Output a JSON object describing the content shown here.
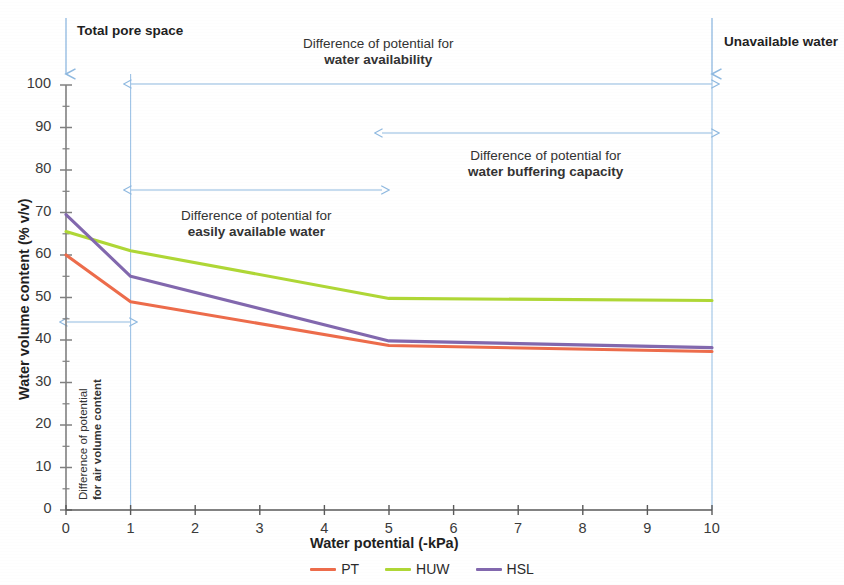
{
  "chart_data": {
    "type": "line",
    "title": "",
    "xlabel": "Water potential (-kPa)",
    "ylabel": "Water volume content (% v/v)",
    "xlim": [
      0,
      10
    ],
    "ylim": [
      0,
      100
    ],
    "xticks": [
      "0",
      "1",
      "2",
      "3",
      "4",
      "5",
      "6",
      "7",
      "8",
      "9",
      "10"
    ],
    "yticks": [
      "0",
      "10",
      "20",
      "30",
      "40",
      "50",
      "60",
      "70",
      "80",
      "90",
      "100"
    ],
    "y_minor_step": 5,
    "grid": false,
    "legend_position": "bottom",
    "x": [
      0,
      1,
      5,
      10
    ],
    "series": [
      {
        "name": "PT",
        "color": "#ED6C4B",
        "values": [
          60.0,
          49.0,
          38.7,
          37.3
        ]
      },
      {
        "name": "HUW",
        "color": "#AFD736",
        "values": [
          65.5,
          61.0,
          49.8,
          49.3
        ]
      },
      {
        "name": "HSL",
        "color": "#8268AE",
        "values": [
          69.5,
          55.0,
          39.8,
          38.2
        ]
      }
    ],
    "annotations": [
      {
        "id": "total-pore-space",
        "text": "Total pore space",
        "style": "bold",
        "at_x": 0,
        "kind": "down-arrow-callout"
      },
      {
        "id": "unavailable-water",
        "text": "Unavailable water",
        "style": "bold",
        "at_x": 10,
        "kind": "down-arrow-callout"
      },
      {
        "id": "water-availability",
        "line1": "Difference of potential for",
        "line2": "water availability",
        "from_x": 1,
        "to_x": 10,
        "kind": "double-arrow"
      },
      {
        "id": "water-buffering-capacity",
        "line1": "Difference of potential for",
        "line2": "water buffering capacity",
        "from_x": 5,
        "to_x": 10,
        "kind": "double-arrow"
      },
      {
        "id": "easily-available-water",
        "line1": "Difference of potential for",
        "line2": "easily available water",
        "from_x": 1,
        "to_x": 5,
        "kind": "double-arrow"
      },
      {
        "id": "air-volume-content",
        "line1": "Difference of potential",
        "line2": "for air volume content",
        "from_x": 0,
        "to_x": 1,
        "kind": "double-arrow-rotated-label"
      }
    ],
    "guide_lines": [
      {
        "at_x": 1,
        "color": "#9DC3E6"
      },
      {
        "at_x": 10,
        "color": "#9DC3E6"
      }
    ]
  },
  "legend": {
    "items": [
      {
        "label": "PT",
        "color": "#ED6C4B"
      },
      {
        "label": "HUW",
        "color": "#AFD736"
      },
      {
        "label": "HSL",
        "color": "#8268AE"
      }
    ]
  },
  "labels": {
    "x_axis_title": "Water potential (-kPa)",
    "y_axis_title": "Water volume content (% v/v)",
    "total_pore_space": "Total pore space",
    "unavailable_water": "Unavailable water",
    "avail_l1": "Difference of potential for",
    "avail_l2": "water availability",
    "buffer_l1": "Difference of potential for",
    "buffer_l2": "water buffering capacity",
    "easily_l1": "Difference of potential for",
    "easily_l2": "easily available water",
    "air_l1": "Difference of potential",
    "air_l2": "for air volume content"
  },
  "ticks": {
    "x": [
      "0",
      "1",
      "2",
      "3",
      "4",
      "5",
      "6",
      "7",
      "8",
      "9",
      "10"
    ],
    "y": [
      "100",
      "90",
      "80",
      "70",
      "60",
      "50",
      "40",
      "30",
      "20",
      "10",
      "0"
    ]
  },
  "colors": {
    "pt": "#ED6C4B",
    "huw": "#AFD736",
    "hsl": "#8268AE",
    "guide": "#9DC3E6",
    "axis": "#7F7F7F"
  }
}
